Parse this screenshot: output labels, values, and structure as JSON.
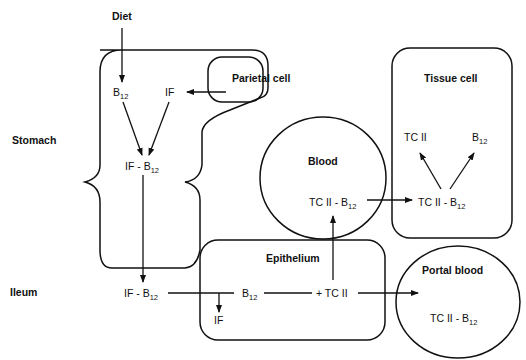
{
  "regions": {
    "stomach": "Stomach",
    "ileum": "Ileum",
    "diet": "Diet"
  },
  "compartments": {
    "parietal_cell": "Parietal cell",
    "tissue_cell": "Tissue cell",
    "blood": "Blood",
    "epithelium": "Epithelium",
    "portal_blood": "Portal blood"
  },
  "species": {
    "b": "B",
    "sub12": "12",
    "if": "IF",
    "if_dash": "IF - B",
    "tc2": "TC II",
    "tc2_dash": "TC II - B",
    "plus_tc2": "+ TC II"
  },
  "colors": {
    "line": "#111111",
    "background": "#ffffff"
  }
}
